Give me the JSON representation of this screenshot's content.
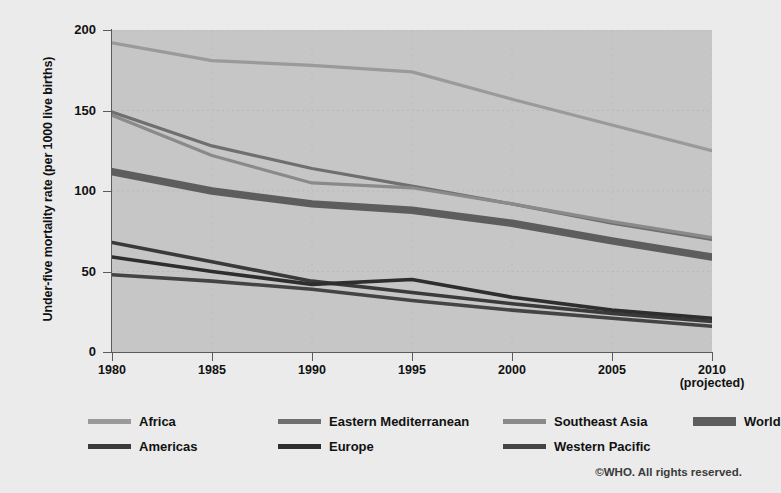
{
  "chart_data": {
    "type": "line",
    "title": "",
    "xlabel": "",
    "ylabel": "Under-five mortality rate (per 1000 live births)",
    "x": [
      1980,
      1985,
      1990,
      1995,
      2000,
      2005,
      2010
    ],
    "xtick_labels": [
      "1980",
      "1985",
      "1990",
      "1995",
      "2000",
      "2005",
      "2010"
    ],
    "xtick_sublabel": "(projected)",
    "xlim": [
      1980,
      2010
    ],
    "ylim": [
      0,
      200
    ],
    "ytick_labels": [
      "0",
      "50",
      "100",
      "150",
      "200"
    ],
    "yticks": [
      0,
      50,
      100,
      150,
      200
    ],
    "grid": true,
    "legend_position": "below",
    "series": [
      {
        "name": "Africa",
        "color": "#9a9a9a",
        "width": 3.2,
        "values": [
          192,
          181,
          178,
          174,
          157,
          141,
          125
        ]
      },
      {
        "name": "Eastern Mediterranean",
        "color": "#6f6f6f",
        "width": 3.2,
        "values": [
          149,
          128,
          114,
          103,
          92,
          80,
          70
        ]
      },
      {
        "name": "Southeast Asia",
        "color": "#8a8a8a",
        "width": 3.2,
        "values": [
          147,
          122,
          105,
          102,
          92,
          81,
          71
        ]
      },
      {
        "name": "World",
        "color": "#5d5d5d",
        "width": 7.5,
        "values": [
          112,
          100,
          92,
          88,
          80,
          69,
          59
        ]
      },
      {
        "name": "Americas",
        "color": "#3a3a3a",
        "width": 3.6,
        "values": [
          68,
          56,
          44,
          37,
          30,
          24,
          19
        ]
      },
      {
        "name": "Europe",
        "color": "#2e2e2e",
        "width": 3.6,
        "values": [
          59,
          50,
          42,
          45,
          34,
          26,
          21
        ]
      },
      {
        "name": "Western Pacific",
        "color": "#444444",
        "width": 3.6,
        "values": [
          48,
          44,
          39,
          32,
          26,
          21,
          16
        ]
      }
    ],
    "annotation": "©WHO. All rights reserved.",
    "plot_background": "#c6c6c6",
    "page_background": "#ebebeb"
  },
  "legend": {
    "row1": [
      {
        "label": "Africa",
        "swatch": "#9a9a9a",
        "thick": false
      },
      {
        "label": "Eastern Mediterranean",
        "swatch": "#6f6f6f",
        "thick": false
      },
      {
        "label": "Southeast Asia",
        "swatch": "#8a8a8a",
        "thick": false
      },
      {
        "label": "World",
        "swatch": "#5d5d5d",
        "thick": true
      }
    ],
    "row2": [
      {
        "label": "Americas",
        "swatch": "#3a3a3a",
        "thick": false
      },
      {
        "label": "Europe",
        "swatch": "#2e2e2e",
        "thick": false
      },
      {
        "label": "Western Pacific",
        "swatch": "#444444",
        "thick": false
      }
    ]
  },
  "footer": {
    "copyright": "©WHO. All rights reserved."
  }
}
